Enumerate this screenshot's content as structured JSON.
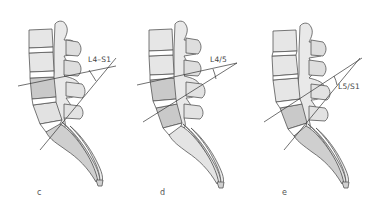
{
  "figure": {
    "colors": {
      "vertebra_light": "#e6e6e6",
      "vertebra_shaded": "#c9c9c9",
      "sacrum_shaded": "#cfcfcf",
      "outline": "#555555",
      "line": "#333333",
      "background": "#ffffff"
    },
    "panels": [
      {
        "letter": "c",
        "angle_label": "L4–S1"
      },
      {
        "letter": "d",
        "angle_label": "L4/5"
      },
      {
        "letter": "e",
        "angle_label": "L5/S1"
      }
    ]
  }
}
